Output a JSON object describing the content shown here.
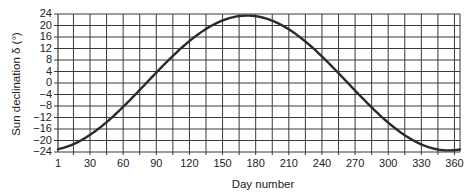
{
  "chart_data": {
    "type": "line",
    "title": "",
    "xlabel": "Day number",
    "ylabel": "Sun declination δ (°)",
    "xlim": [
      1,
      365
    ],
    "ylim": [
      -24,
      24
    ],
    "grid": true,
    "legend": "none",
    "x_ticks": [
      1,
      30,
      60,
      90,
      120,
      150,
      180,
      210,
      240,
      270,
      300,
      330,
      360
    ],
    "y_ticks": [
      24,
      20,
      16,
      12,
      8,
      4,
      0,
      -4,
      -8,
      -12,
      -16,
      -20,
      -24
    ],
    "series": [
      {
        "name": "Sun declination",
        "formula": "23.45 * sin(360/365 * (284 + n))",
        "x": [
          1,
          15,
          30,
          45,
          60,
          75,
          90,
          105,
          120,
          135,
          150,
          165,
          172,
          180,
          195,
          210,
          225,
          240,
          255,
          270,
          285,
          300,
          315,
          330,
          345,
          355,
          365
        ],
        "values": [
          -23.0,
          -21.3,
          -17.8,
          -13.3,
          -8.3,
          -2.4,
          3.6,
          9.4,
          14.3,
          18.5,
          21.6,
          23.3,
          23.45,
          23.2,
          21.5,
          18.1,
          13.5,
          7.8,
          1.8,
          -4.2,
          -9.9,
          -15.0,
          -19.2,
          -22.1,
          -23.4,
          -23.3,
          -23.1
        ]
      }
    ]
  },
  "labels": {
    "xlabel": "Day number",
    "ylabel": "Sun declination δ (°)"
  }
}
